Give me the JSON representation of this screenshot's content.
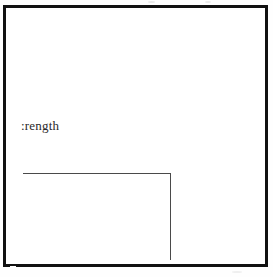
{
  "figure": {
    "type": "scanned-line-figure",
    "background_color": "#fefefe",
    "frame": {
      "border_color": "#111111",
      "border_width_px": 3,
      "fill_color": "#ffffff"
    },
    "label": {
      "text": ":rength",
      "note_text": "strength",
      "color": "#2a2a2a"
    },
    "step_line": {
      "color": "#4a4a4a",
      "horizontal_label": "horizontal-segment",
      "vertical_label": "vertical-segment"
    }
  },
  "chart_data": {
    "type": "line",
    "title": "",
    "subtitle": "",
    "xlabel": "",
    "ylabel": ":rength",
    "grid": false,
    "legend": null,
    "annotations": [],
    "xtick_labels": [],
    "ytick_labels": [],
    "xlim": [
      0,
      100
    ],
    "ylim": [
      0,
      100
    ],
    "series": [
      {
        "name": "step-curve",
        "x": [
          0,
          59,
          59
        ],
        "y": [
          62,
          62,
          27
        ]
      }
    ]
  }
}
